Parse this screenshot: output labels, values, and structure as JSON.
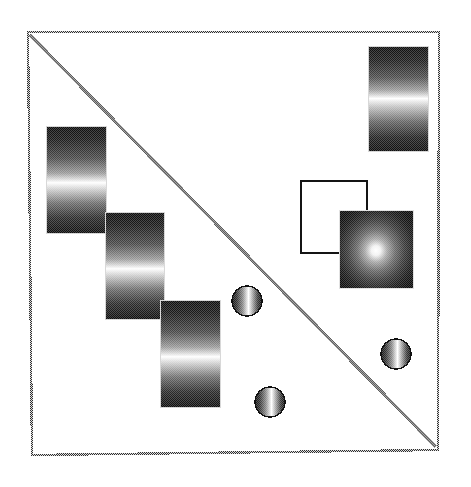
{
  "document": {
    "title": "Dithered Gradient Shape Composition",
    "width": 471,
    "height": 487,
    "background_color": "#ffffff",
    "ink_color": "#000000",
    "halftone_pattern": "ordered-dither checkerboard"
  },
  "frame": {
    "name": "outer-frame",
    "style": "dithered-halftone-stroke",
    "stroke_color": "#3a3a3a",
    "stroke_width": 2,
    "corners": {
      "top_left": {
        "x": 28,
        "y": 32
      },
      "top_right": {
        "x": 439,
        "y": 32
      },
      "bottom_right": {
        "x": 438,
        "y": 450
      },
      "bottom_left": {
        "x": 32,
        "y": 455
      }
    }
  },
  "diagonal": {
    "name": "diagonal-line",
    "stroke_color": "#6b6b6b",
    "stroke_width": 3,
    "from": {
      "x": 30,
      "y": 35
    },
    "to": {
      "x": 436,
      "y": 447
    }
  },
  "shapes": {
    "staircase_label": "Linear gradient staircase (3 blocks)",
    "staircase_blocks": [
      {
        "name": "gradient-block-1",
        "x": 46,
        "y": 126,
        "width": 60,
        "height": 107,
        "gradient": "vertical",
        "highlight_stop": 0.53
      },
      {
        "name": "gradient-block-2",
        "x": 105,
        "y": 212,
        "width": 59,
        "height": 107,
        "gradient": "vertical",
        "highlight_stop": 0.54
      },
      {
        "name": "gradient-block-3",
        "x": 160,
        "y": 300,
        "width": 60,
        "height": 107,
        "gradient": "vertical",
        "highlight_stop": 0.54
      }
    ],
    "top_right_block": {
      "name": "gradient-block-top-right",
      "x": 368,
      "y": 46,
      "width": 60,
      "height": 105,
      "gradient": "vertical",
      "highlight_stop": 0.5
    },
    "outlined_square": {
      "name": "outlined-square",
      "x": 301,
      "y": 181,
      "width": 66,
      "height": 72,
      "fill": "none",
      "stroke_color": "#1a1a1a",
      "stroke_width": 2
    },
    "radial_square": {
      "name": "radial-gradient-square",
      "x": 339,
      "y": 210,
      "width": 74,
      "height": 78,
      "gradient": "radial",
      "center": {
        "x": 0.5,
        "y": 0.52
      },
      "highlight_radius": 0.12
    },
    "spheres": [
      {
        "name": "sphere-1",
        "cx": 247,
        "cy": 301,
        "r": 15,
        "gradient": "horizontal",
        "highlight_stop": 0.55
      },
      {
        "name": "sphere-2",
        "cx": 396,
        "cy": 354,
        "r": 15,
        "gradient": "horizontal",
        "highlight_stop": 0.55
      },
      {
        "name": "sphere-3",
        "cx": 270,
        "cy": 402,
        "r": 15,
        "gradient": "horizontal",
        "highlight_stop": 0.55
      }
    ]
  },
  "palette": {
    "dark": "#141414",
    "mid": "#6f6f6f",
    "highlight": "#ffffff",
    "frame_gray": "#3a3a3a",
    "diagonal_gray": "#6b6b6b"
  }
}
